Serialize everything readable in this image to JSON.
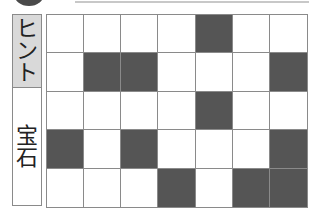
{
  "puzzle": {
    "labels": {
      "hint": "ヒント",
      "gem": "宝石"
    },
    "grid": {
      "rows": 5,
      "cols": 7,
      "filled": [
        [
          0,
          0,
          0,
          0,
          1,
          0,
          0
        ],
        [
          0,
          1,
          1,
          0,
          0,
          0,
          1
        ],
        [
          0,
          0,
          0,
          0,
          1,
          0,
          0
        ],
        [
          1,
          0,
          1,
          0,
          0,
          0,
          1
        ],
        [
          0,
          0,
          0,
          1,
          0,
          1,
          1
        ]
      ]
    },
    "colors": {
      "filled": "#555555",
      "empty": "#ffffff",
      "hint_bg": "#d9d9d9",
      "border": "#8a8a8a"
    }
  }
}
